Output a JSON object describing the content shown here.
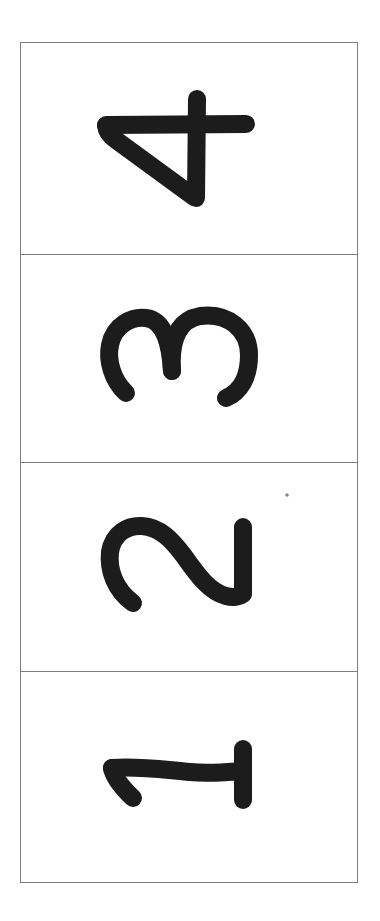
{
  "layout": {
    "orientation": "rotated-90-ccw",
    "ink_color": "#1c1c1c",
    "border_color": "#7d7d7d",
    "background_color": "#ffffff"
  },
  "panels": [
    {
      "position": "top",
      "digit": "4",
      "label": "Digit 4"
    },
    {
      "position": "second",
      "digit": "3",
      "label": "Digit 3"
    },
    {
      "position": "third",
      "digit": "2",
      "label": "Digit 2"
    },
    {
      "position": "bottom",
      "digit": "1",
      "label": "Digit 1"
    }
  ],
  "artifacts": [
    {
      "type": "dot",
      "panel": "third",
      "color": "#8a8a8a"
    }
  ]
}
